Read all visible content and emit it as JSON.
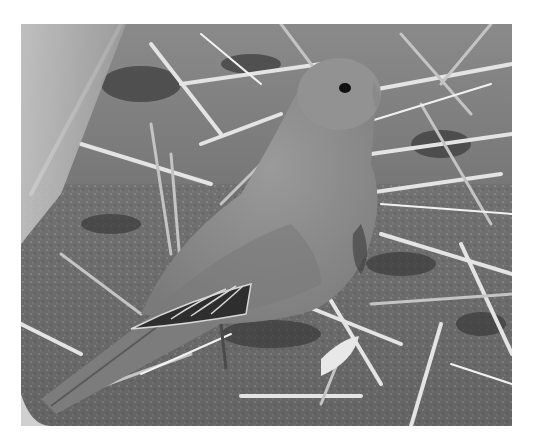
{
  "image": {
    "subject": "parrot",
    "scene": "bird standing on ground among dry straw",
    "palette": {
      "background": "#ffffff",
      "ground": "#6e6e6e",
      "ground_dark": "#3c3c3c",
      "straw_light": "#e6e6e6",
      "straw_mid": "#bdbdbd",
      "bird_body": "#8c8c8c",
      "bird_shadow": "#6a6a6a",
      "wing_dark": "#2e2e2e",
      "wing_edge": "#d8d8d8",
      "eye": "#111111",
      "left_glass": "#b5b5b5"
    }
  }
}
